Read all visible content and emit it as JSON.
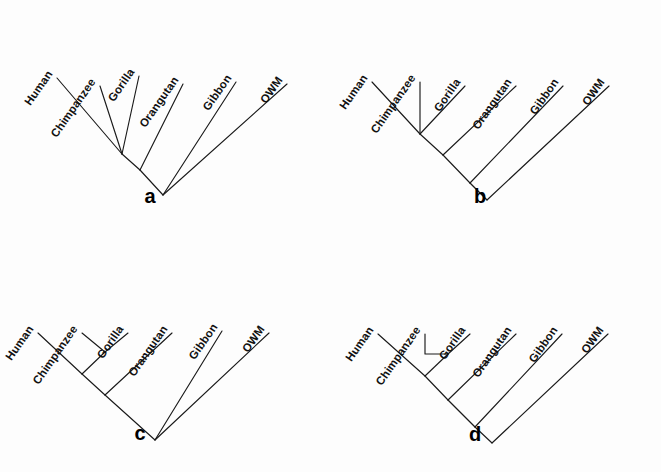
{
  "figure": {
    "width": 661,
    "height": 472,
    "background_color": "#fdfdfd",
    "line_color": "#1a1a1a",
    "text_color": "#111111",
    "label_rotation_deg": -55
  },
  "taxa": [
    "Human",
    "Chimpanzee",
    "Gorilla",
    "Orangutan",
    "Gibbon",
    "OWM"
  ],
  "panels": [
    {
      "id": "a",
      "letter": "a",
      "origin_x": 0,
      "origin_y": 0,
      "letter_pos": {
        "x": 150,
        "y": 203
      },
      "leaves": [
        {
          "name": "Human",
          "tip": {
            "x": 57,
            "y": 78
          },
          "label": {
            "x": 53,
            "y": 74
          }
        },
        {
          "name": "Chimpanzee",
          "tip": {
            "x": 100,
            "y": 86
          },
          "label": {
            "x": 96,
            "y": 82
          }
        },
        {
          "name": "Gorilla",
          "tip": {
            "x": 139,
            "y": 76
          },
          "label": {
            "x": 135,
            "y": 72
          }
        },
        {
          "name": "Orangutan",
          "tip": {
            "x": 183,
            "y": 84
          },
          "label": {
            "x": 179,
            "y": 80
          }
        },
        {
          "name": "Gibbon",
          "tip": {
            "x": 236,
            "y": 82
          },
          "label": {
            "x": 232,
            "y": 78
          }
        },
        {
          "name": "OWM",
          "tip": {
            "x": 287,
            "y": 84
          },
          "label": {
            "x": 283,
            "y": 80
          }
        }
      ],
      "nodes": {
        "hcg": {
          "x": 122,
          "y": 154
        },
        "hcgo": {
          "x": 140,
          "y": 170
        },
        "root": {
          "x": 163,
          "y": 195
        }
      },
      "edges": [
        {
          "name": "human-branch",
          "path": "M 57 78 L 122 154"
        },
        {
          "name": "chimpanzee-branch",
          "path": "M 100 86 L 122 154"
        },
        {
          "name": "gorilla-branch",
          "path": "M 139 76 L 122 154"
        },
        {
          "name": "orangutan-branch",
          "path": "M 183 84 L 140 170"
        },
        {
          "name": "hcg-stem",
          "path": "M 122 154 L 140 170"
        },
        {
          "name": "gibbon-branch",
          "path": "M 236 82 L 163 195"
        },
        {
          "name": "hcgo-stem",
          "path": "M 140 170 L 163 195"
        },
        {
          "name": "owm-branch",
          "path": "M 287 84 L 163 195"
        }
      ],
      "topology": "(((Human,Chimpanzee,Gorilla),Orangutan),Gibbon,OWM)",
      "description": "Human, Chimpanzee and Gorilla form an unresolved trichotomy"
    },
    {
      "id": "b",
      "letter": "b",
      "origin_x": 330,
      "origin_y": 0,
      "letter_pos": {
        "x": 480,
        "y": 203
      },
      "leaves": [
        {
          "name": "Human",
          "tip": {
            "x": 372,
            "y": 82
          },
          "label": {
            "x": 368,
            "y": 78
          }
        },
        {
          "name": "Chimpanzee",
          "tip": {
            "x": 420,
            "y": 82
          },
          "label": {
            "x": 416,
            "y": 78
          }
        },
        {
          "name": "Gorilla",
          "tip": {
            "x": 465,
            "y": 86
          },
          "label": {
            "x": 461,
            "y": 82
          }
        },
        {
          "name": "Orangutan",
          "tip": {
            "x": 516,
            "y": 86
          },
          "label": {
            "x": 512,
            "y": 82
          }
        },
        {
          "name": "Gibbon",
          "tip": {
            "x": 563,
            "y": 86
          },
          "label": {
            "x": 559,
            "y": 82
          }
        },
        {
          "name": "OWM",
          "tip": {
            "x": 609,
            "y": 86
          },
          "label": {
            "x": 605,
            "y": 82
          }
        }
      ],
      "nodes": {
        "hcg": {
          "x": 420,
          "y": 134
        },
        "hcgo": {
          "x": 443,
          "y": 155
        },
        "hcgog": {
          "x": 470,
          "y": 183
        },
        "root": {
          "x": 487,
          "y": 200
        }
      },
      "edges": [
        {
          "name": "human-branch",
          "path": "M 372 82 L 420 134"
        },
        {
          "name": "chimpanzee-branch",
          "path": "M 420 82 L 420 134"
        },
        {
          "name": "gorilla-branch",
          "path": "M 465 86 L 420 134"
        },
        {
          "name": "hcg-stem",
          "path": "M 420 134 L 443 155"
        },
        {
          "name": "orangutan-branch",
          "path": "M 516 86 L 443 155"
        },
        {
          "name": "hcgo-stem",
          "path": "M 443 155 L 470 183"
        },
        {
          "name": "gibbon-branch",
          "path": "M 563 86 L 470 183"
        },
        {
          "name": "hcgog-stem",
          "path": "M 470 183 L 487 200"
        },
        {
          "name": "owm-branch",
          "path": "M 609 86 L 487 200"
        }
      ],
      "topology": "((((Human,Chimpanzee,Gorilla),Orangutan),Gibbon),OWM)",
      "description": "Trichotomy of Human, Chimpanzee, Gorilla with fully resolved outgroups"
    },
    {
      "id": "c",
      "letter": "c",
      "origin_x": 0,
      "origin_y": 236,
      "letter_pos": {
        "x": 140,
        "y": 440
      },
      "leaves": [
        {
          "name": "Human",
          "tip": {
            "x": 38,
            "y": 333
          },
          "label": {
            "x": 34,
            "y": 329
          }
        },
        {
          "name": "Chimpanzee",
          "tip": {
            "x": 82,
            "y": 333
          },
          "label": {
            "x": 78,
            "y": 329
          }
        },
        {
          "name": "Gorilla",
          "tip": {
            "x": 128,
            "y": 333
          },
          "label": {
            "x": 124,
            "y": 329
          }
        },
        {
          "name": "Orangutan",
          "tip": {
            "x": 172,
            "y": 333
          },
          "label": {
            "x": 168,
            "y": 329
          }
        },
        {
          "name": "Gibbon",
          "tip": {
            "x": 222,
            "y": 331
          },
          "label": {
            "x": 218,
            "y": 327
          }
        },
        {
          "name": "OWM",
          "tip": {
            "x": 269,
            "y": 333
          },
          "label": {
            "x": 265,
            "y": 329
          }
        }
      ],
      "nodes": {
        "cg": {
          "x": 105,
          "y": 352
        },
        "hcg": {
          "x": 82,
          "y": 374
        },
        "hcgo": {
          "x": 105,
          "y": 395
        },
        "root": {
          "x": 155,
          "y": 440
        }
      },
      "edges": [
        {
          "name": "chimpanzee-branch",
          "path": "M 82 333 L 105 352"
        },
        {
          "name": "gorilla-branch",
          "path": "M 128 333 L 105 352"
        },
        {
          "name": "cg-stem",
          "path": "M 105 352 L 82 374"
        },
        {
          "name": "human-branch",
          "path": "M 38 333 L 82 374"
        },
        {
          "name": "hcg-stem",
          "path": "M 82 374 L 105 395"
        },
        {
          "name": "orangutan-branch",
          "path": "M 172 333 L 105 395"
        },
        {
          "name": "hcgo-stem",
          "path": "M 105 395 L 155 440"
        },
        {
          "name": "gibbon-branch",
          "path": "M 222 331 L 155 440"
        },
        {
          "name": "owm-branch",
          "path": "M 269 333 L 155 440"
        }
      ],
      "topology": "(((Human,(Chimpanzee,Gorilla)),Orangutan),Gibbon,OWM)",
      "description": "Chimpanzee and Gorilla are sister taxa; Gibbon and OWM form a basal trichotomy"
    },
    {
      "id": "d",
      "letter": "d",
      "origin_x": 330,
      "origin_y": 236,
      "letter_pos": {
        "x": 475,
        "y": 441
      },
      "leaves": [
        {
          "name": "Human",
          "tip": {
            "x": 378,
            "y": 334
          },
          "label": {
            "x": 374,
            "y": 330
          }
        },
        {
          "name": "Chimpanzee",
          "tip": {
            "x": 425,
            "y": 334
          },
          "label": {
            "x": 421,
            "y": 330
          }
        },
        {
          "name": "Gorilla",
          "tip": {
            "x": 470,
            "y": 334
          },
          "label": {
            "x": 466,
            "y": 330
          }
        },
        {
          "name": "Orangutan",
          "tip": {
            "x": 516,
            "y": 334
          },
          "label": {
            "x": 512,
            "y": 330
          }
        },
        {
          "name": "Gibbon",
          "tip": {
            "x": 562,
            "y": 334
          },
          "label": {
            "x": 558,
            "y": 330
          }
        },
        {
          "name": "OWM",
          "tip": {
            "x": 608,
            "y": 334
          },
          "label": {
            "x": 604,
            "y": 330
          }
        },
        {
          "name": "__cg_node__",
          "tip": {
            "x": 448,
            "y": 354
          },
          "label": null
        }
      ],
      "nodes": {
        "cg": {
          "x": 448,
          "y": 354
        },
        "hcg": {
          "x": 425,
          "y": 376
        },
        "hcgo": {
          "x": 448,
          "y": 400
        },
        "hcgog": {
          "x": 475,
          "y": 427
        },
        "root": {
          "x": 492,
          "y": 443
        }
      },
      "edges": [
        {
          "name": "chimpanzee-branch",
          "path": "M 425 334 L 425 354 L 448 354"
        },
        {
          "name": "gorilla-branch",
          "path": "M 470 334 L 448 354"
        },
        {
          "name": "cg-stem",
          "path": "M 448 354 L 425 376"
        },
        {
          "name": "human-branch",
          "path": "M 378 334 L 425 376"
        },
        {
          "name": "hcg-stem",
          "path": "M 425 376 L 448 400"
        },
        {
          "name": "orangutan-branch",
          "path": "M 516 334 L 448 400"
        },
        {
          "name": "hcgo-stem",
          "path": "M 448 400 L 475 427"
        },
        {
          "name": "gibbon-branch",
          "path": "M 562 334 L 475 427"
        },
        {
          "name": "hcgog-stem",
          "path": "M 475 427 L 492 443"
        },
        {
          "name": "owm-branch",
          "path": "M 608 334 L 492 443"
        }
      ],
      "topology": "((((Human,(Chimpanzee,Gorilla)),Orangutan),Gibbon),OWM)",
      "description": "Chimpanzee and Gorilla sister taxa with fully resolved outgroup order"
    }
  ]
}
